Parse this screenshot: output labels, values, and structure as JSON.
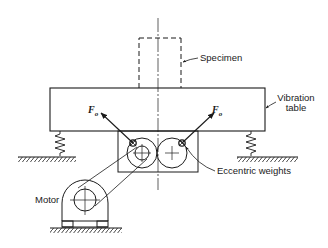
{
  "diagram": {
    "type": "mechanical schematic",
    "labels": {
      "specimen": "Specimen",
      "vibration_table_line1": "Vibration",
      "vibration_table_line2": "table",
      "eccentric_weights": "Eccentric weights",
      "motor": "Motor",
      "force_left": "F",
      "force_left_sub": "o",
      "force_right": "F",
      "force_right_sub": "o"
    },
    "components": [
      "specimen",
      "vibration table",
      "springs (2)",
      "ground supports",
      "gear housing with two counter-rotating wheels",
      "eccentric weights (2)",
      "belt drive",
      "motor"
    ],
    "colors": {
      "line": "#1a1a1a",
      "background": "#ffffff"
    }
  }
}
